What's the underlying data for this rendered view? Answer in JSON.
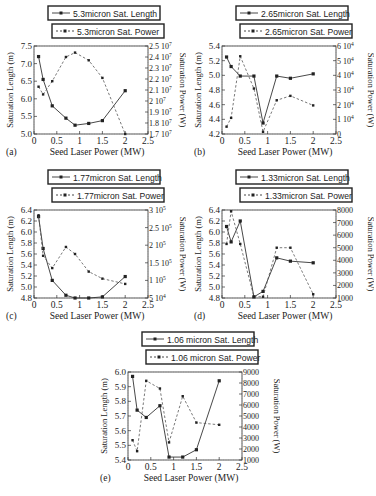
{
  "chart_data": [
    {
      "panel": "(a)",
      "type": "line",
      "xlabel": "Seed Laser Power (MW)",
      "ylabel": "Saturation Length (m)",
      "y2label": "Saturation Power (W)",
      "xlim": [
        0,
        2.5
      ],
      "xticks": [
        "0",
        "0.5",
        "1",
        "1.5",
        "2",
        "2.5"
      ],
      "ylim": [
        5.0,
        7.5
      ],
      "yticks": [
        "5.0",
        "5.5",
        "6.0",
        "6.5",
        "7.0",
        "7.5"
      ],
      "y2lim": [
        17000000,
        25000000
      ],
      "y2ticks": [
        "1.7 10^7",
        "1.8 10^7",
        "1.9 10^7",
        "2 10^7",
        "2.1 10^7",
        "2.2 10^7",
        "2.3 10^7",
        "2.4 10^7",
        "2.5 10^7"
      ],
      "x": [
        0.1,
        0.2,
        0.4,
        0.7,
        0.9,
        1.2,
        1.5,
        2.0
      ],
      "series": [
        {
          "name": "5.3micron Sat. Length",
          "axis": "left",
          "style": "solid",
          "values": [
            7.2,
            6.55,
            5.8,
            5.45,
            5.25,
            5.3,
            5.38,
            6.23
          ]
        },
        {
          "name": "5.3micron Sat. Power",
          "axis": "right",
          "style": "dashed",
          "values": [
            21300000,
            20600000,
            21800000,
            24000000,
            24400000,
            23700000,
            22100000,
            17000000
          ]
        }
      ]
    },
    {
      "panel": "(b)",
      "type": "line",
      "xlabel": "Seed Laser Power (MW)",
      "ylabel": "Saturation Length (m)",
      "y2label": "Saturation Power (W)",
      "xlim": [
        0,
        2.5
      ],
      "xticks": [
        "0",
        "0.5",
        "1",
        "1.5",
        "2",
        "2.5"
      ],
      "ylim": [
        4.2,
        5.4
      ],
      "yticks": [
        "4.2",
        "4.4",
        "4.6",
        "4.8",
        "5.0",
        "5.2",
        "5.4"
      ],
      "y2lim": [
        0,
        60000
      ],
      "y2ticks": [
        "0",
        "1 10^4",
        "2 10^4",
        "3 10^4",
        "4 10^4",
        "5 10^4",
        "6 10^4"
      ],
      "x": [
        0.1,
        0.2,
        0.4,
        0.7,
        0.9,
        1.2,
        1.5,
        2.0
      ],
      "series": [
        {
          "name": "2.65micron Sat. Length",
          "axis": "left",
          "style": "solid",
          "values": [
            5.25,
            5.12,
            4.99,
            4.99,
            4.35,
            4.99,
            4.96,
            5.02
          ]
        },
        {
          "name": "2.65micron Sat. Power",
          "axis": "right",
          "style": "dashed",
          "values": [
            5000,
            11000,
            53000,
            31000,
            1500,
            23000,
            26000,
            19500
          ]
        }
      ]
    },
    {
      "panel": "(c)",
      "type": "line",
      "xlabel": "Seed Laser Power (MW)",
      "ylabel": "Saturation Length (m)",
      "y2label": "Saturation Power (W)",
      "xlim": [
        0,
        2.5
      ],
      "xticks": [
        "0",
        "0.5",
        "1",
        "1.5",
        "2",
        "2.5"
      ],
      "ylim": [
        4.8,
        6.4
      ],
      "yticks": [
        "4.8",
        "5.0",
        "5.2",
        "5.4",
        "5.6",
        "5.8",
        "6.0",
        "6.2",
        "6.4"
      ],
      "y2lim": [
        50000,
        300000
      ],
      "y2ticks": [
        "5 10^4",
        "1 10^5",
        "1.5 10^5",
        "2 10^5",
        "2.5 10^5",
        "3 10^5"
      ],
      "x": [
        0.1,
        0.2,
        0.4,
        0.7,
        0.9,
        1.2,
        1.5,
        2.0
      ],
      "series": [
        {
          "name": "1.77micron Sat. Length",
          "axis": "left",
          "style": "solid",
          "values": [
            6.28,
            5.7,
            5.12,
            4.85,
            4.8,
            4.8,
            4.82,
            5.19
          ]
        },
        {
          "name": "1.77micron Sat. Power",
          "axis": "right",
          "style": "dashed",
          "values": [
            285000,
            170000,
            135000,
            195000,
            175000,
            125000,
            105000,
            90000
          ]
        }
      ]
    },
    {
      "panel": "(d)",
      "type": "line",
      "xlabel": "Seed Laser Power (MW)",
      "ylabel": "Saturation Length (m)",
      "y2label": "Saturation Power (W)",
      "xlim": [
        0,
        2.5
      ],
      "xticks": [
        "0",
        "0.5",
        "1",
        "1.5",
        "2",
        "2.5"
      ],
      "ylim": [
        4.8,
        6.4
      ],
      "yticks": [
        "4.8",
        "5.0",
        "5.2",
        "5.4",
        "5.6",
        "5.8",
        "6.0",
        "6.2",
        "6.4"
      ],
      "y2lim": [
        1000,
        8000
      ],
      "y2ticks": [
        "1000",
        "2000",
        "3000",
        "4000",
        "5000",
        "6000",
        "7000",
        "8000"
      ],
      "x": [
        0.1,
        0.2,
        0.4,
        0.7,
        0.9,
        1.2,
        1.5,
        2.0
      ],
      "series": [
        {
          "name": "1.33micron Sat. Length",
          "axis": "left",
          "style": "solid",
          "values": [
            6.1,
            5.82,
            6.2,
            4.82,
            4.92,
            5.53,
            5.47,
            5.44
          ]
        },
        {
          "name": "1.33micron Sat. Power",
          "axis": "right",
          "style": "dashed",
          "values": [
            5300,
            7900,
            5300,
            1100,
            1100,
            5000,
            5000,
            1300
          ]
        }
      ]
    },
    {
      "panel": "(e)",
      "type": "line",
      "xlabel": "Seed Laser Power (MW)",
      "ylabel": "Saturation Length (m)",
      "y2label": "Saturation Power (W)",
      "xlim": [
        0,
        2.5
      ],
      "xticks": [
        "0",
        "0.5",
        "1",
        "1.5",
        "2",
        "2.5"
      ],
      "ylim": [
        5.4,
        6.0
      ],
      "yticks": [
        "5.4",
        "5.5",
        "5.6",
        "5.7",
        "5.8",
        "5.9",
        "6.0"
      ],
      "y2lim": [
        1000,
        9000
      ],
      "y2ticks": [
        "1000",
        "2000",
        "3000",
        "4000",
        "5000",
        "6000",
        "7000",
        "8000",
        "9000"
      ],
      "x": [
        0.1,
        0.2,
        0.4,
        0.7,
        0.9,
        1.2,
        1.5,
        2.0
      ],
      "series": [
        {
          "name": "1.06 micron Sat. Length",
          "axis": "left",
          "style": "solid",
          "values": [
            5.97,
            5.74,
            5.69,
            5.77,
            5.42,
            5.42,
            5.47,
            5.94
          ]
        },
        {
          "name": "1.06 micron Sat. Power",
          "axis": "right",
          "style": "dashed",
          "values": [
            2800,
            1800,
            8200,
            7500,
            2600,
            6800,
            4400,
            4200
          ]
        }
      ]
    }
  ],
  "panels": [
    {
      "left": 4,
      "top": 4,
      "legend_w": 148
    },
    {
      "left": 192,
      "top": 4,
      "legend_w": 148
    },
    {
      "left": 4,
      "top": 168,
      "legend_w": 148
    },
    {
      "left": 192,
      "top": 168,
      "legend_w": 148
    },
    {
      "left": 98,
      "top": 330,
      "legend_w": 148
    }
  ]
}
